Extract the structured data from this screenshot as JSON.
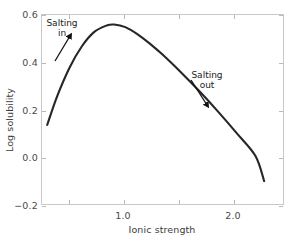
{
  "chart_data": {
    "type": "line",
    "title": "",
    "subtitle": "",
    "xlabel": "Ionic strength",
    "ylabel": "Log solubility",
    "grid": false,
    "legend_position": "none",
    "xlim": [
      0.27,
      2.23
    ],
    "ylim": [
      -0.2,
      0.6
    ],
    "x_ticks": [
      0.5,
      1.0,
      1.5,
      2.0
    ],
    "x_tick_labels": [
      "",
      "1.0",
      "",
      "2.0"
    ],
    "y_ticks": [
      -0.2,
      0.0,
      0.2,
      0.4,
      0.6
    ],
    "y_tick_labels": [
      "−0.2",
      "0.0",
      "0.2",
      "0.4",
      "0.6"
    ],
    "series": [
      {
        "name": "Log solubility vs ionic strength",
        "color": "#262626",
        "x": [
          0.32,
          0.4,
          0.5,
          0.6,
          0.7,
          0.8,
          0.86,
          0.95,
          1.05,
          1.15,
          1.25,
          1.4,
          1.55,
          1.7,
          1.85,
          2.0,
          2.07
        ],
        "y": [
          0.135,
          0.255,
          0.375,
          0.465,
          0.525,
          0.552,
          0.556,
          0.545,
          0.515,
          0.475,
          0.43,
          0.355,
          0.275,
          0.19,
          0.1,
          0.005,
          -0.1
        ]
      }
    ],
    "annotations": [
      {
        "id": "salting-in",
        "lines": [
          "Salting",
          "in"
        ],
        "arrow_from": [
          55,
          61
        ],
        "arrow_to": [
          70,
          36
        ],
        "direction": "up-right"
      },
      {
        "id": "salting-out",
        "lines": [
          "Salting",
          "out"
        ],
        "arrow_from": [
          191,
          80
        ],
        "arrow_to": [
          207,
          105
        ],
        "direction": "down-left"
      }
    ]
  },
  "axes": {
    "y": {
      "title": "Log solubility",
      "ticks": [
        {
          "label": "0.6",
          "value": 0.6,
          "py": 14
        },
        {
          "label": "0.4",
          "value": 0.4,
          "py": 62
        },
        {
          "label": "0.2",
          "value": 0.2,
          "py": 110
        },
        {
          "label": "0.0",
          "value": 0.0,
          "py": 157
        },
        {
          "label": "−0.2",
          "value": -0.2,
          "py": 205
        }
      ]
    },
    "x": {
      "title": "Ionic strength",
      "ticks": [
        {
          "label": "",
          "value": 0.5,
          "px": 68
        },
        {
          "label": "1.0",
          "value": 1.0,
          "px": 123
        },
        {
          "label": "",
          "value": 1.5,
          "px": 178
        },
        {
          "label": "2.0",
          "value": 2.0,
          "px": 233
        }
      ]
    }
  },
  "annotations": {
    "salting_in": {
      "line1": "Salting",
      "line2": "in"
    },
    "salting_out": {
      "line1": "Salting",
      "line2": "out"
    }
  },
  "style": {
    "curve_color": "#262626",
    "frame_color": "#c9c9c9",
    "tick_color": "#b9b9b9",
    "text_color": "#3c3c3c",
    "background": "#ffffff"
  }
}
